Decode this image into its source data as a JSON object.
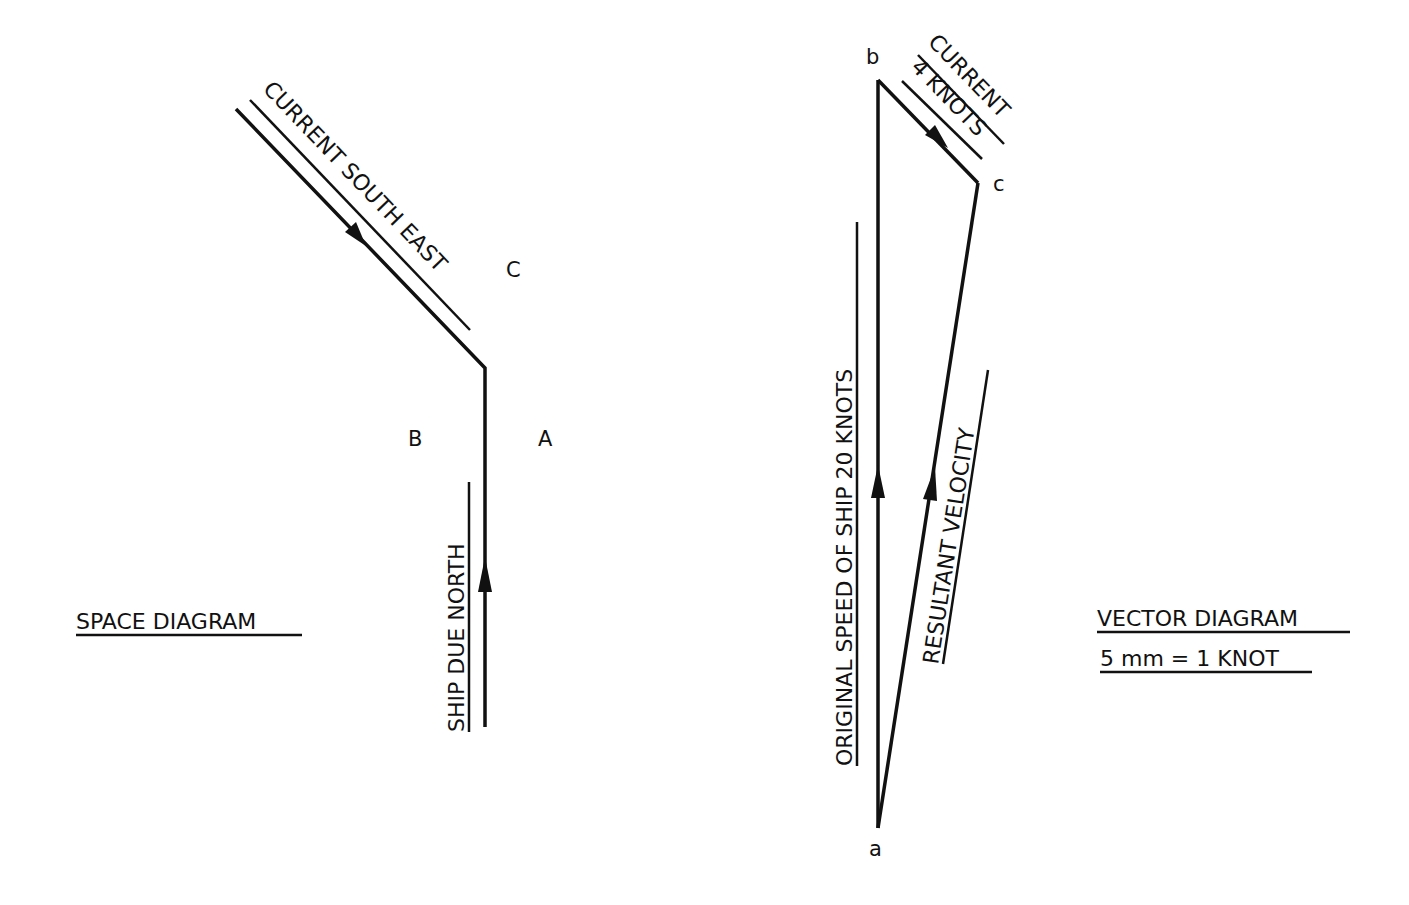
{
  "space_diagram": {
    "title": "SPACE DIAGRAM",
    "current_label": "CURRENT SOUTH EAST",
    "ship_label": "SHIP DUE NORTH",
    "points": {
      "A": "A",
      "B": "B",
      "C": "C"
    }
  },
  "vector_diagram": {
    "title": "VECTOR DIAGRAM",
    "scale": "5 mm = 1 KNOT",
    "current_label_line1": "CURRENT",
    "current_label_line2": "4 KNOTS",
    "ship_label": "ORIGINAL SPEED OF SHIP 20 KNOTS",
    "resultant_label": "RESULTANT VELOCITY",
    "points": {
      "a": "a",
      "b": "b",
      "c": "c"
    }
  },
  "colors": {
    "ink": "#111111",
    "background": "#ffffff"
  }
}
